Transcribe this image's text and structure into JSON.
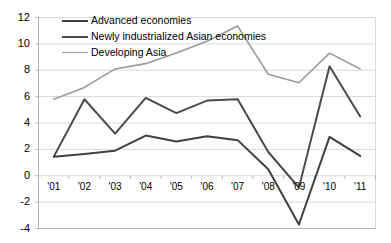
{
  "chart_data": {
    "type": "line",
    "title": "",
    "xlabel": "",
    "ylabel": "",
    "grid": true,
    "legend_position": "top-left-inside",
    "categories": [
      "'01",
      "'02",
      "'03",
      "'04",
      "'05",
      "'06",
      "'07",
      "'08",
      "'09",
      "'10",
      "'11"
    ],
    "ylim": [
      -4,
      12
    ],
    "yticks": [
      "12",
      "10",
      "8",
      "6",
      "4",
      "2",
      "0",
      "-2",
      "-4"
    ],
    "ytick_values": [
      12,
      10,
      8,
      6,
      4,
      2,
      0,
      -2,
      -4
    ],
    "series": [
      {
        "name": "Advanced economies",
        "color": "#404040",
        "values": [
          1.45,
          1.65,
          1.9,
          3.05,
          2.6,
          3.0,
          2.7,
          0.5,
          -3.7,
          2.95,
          1.5
        ]
      },
      {
        "name": "Newly industrialized Asian economies",
        "color": "#4a4a4a",
        "values": [
          1.45,
          5.8,
          3.2,
          5.9,
          4.75,
          5.7,
          5.8,
          1.8,
          -0.9,
          8.3,
          4.5
        ]
      },
      {
        "name": "Developing Asia",
        "color": "#9a9a9a",
        "values": [
          5.8,
          6.7,
          8.1,
          8.5,
          9.3,
          10.2,
          11.35,
          7.7,
          7.05,
          9.3,
          8.1
        ]
      }
    ]
  },
  "axis": {
    "y_labels": [
      "12",
      "10",
      "8",
      "6",
      "4",
      "2",
      "0",
      "-2",
      "-4"
    ],
    "x_labels": [
      "'01",
      "'02",
      "'03",
      "'04",
      "'05",
      "'06",
      "'07",
      "'08",
      "'09",
      "'10",
      "'11"
    ]
  },
  "legend": {
    "items": [
      {
        "label": "Advanced economies",
        "color": "#404040"
      },
      {
        "label": "Newly industrialized Asian economies",
        "color": "#4a4a4a"
      },
      {
        "label": "Developing Asia",
        "color": "#9a9a9a"
      }
    ]
  },
  "colors": {
    "advanced": "#404040",
    "nie": "#4a4a4a",
    "developing_asia": "#9a9a9a",
    "gridline": "#d9d9d9",
    "axis": "#b3b3b3",
    "background": "#ffffff"
  }
}
